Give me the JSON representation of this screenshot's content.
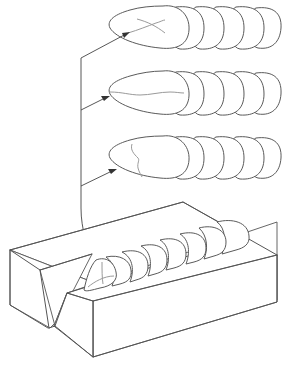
{
  "diagram": {
    "title": "",
    "colors": {
      "background": "#ffffff",
      "outline": "#555555",
      "crack": "#9a9a9a",
      "arrow": "#333333"
    },
    "details": [
      {
        "id": "detail-1",
        "crack_type": "star/crossing crack",
        "ripples": 6
      },
      {
        "id": "detail-2",
        "crack_type": "longitudinal crack",
        "ripples": 6
      },
      {
        "id": "detail-3",
        "crack_type": "transverse crack",
        "ripples": 6
      }
    ],
    "workpiece": {
      "type": "V-groove block with weld bead",
      "ripples": 7
    },
    "labels": []
  }
}
